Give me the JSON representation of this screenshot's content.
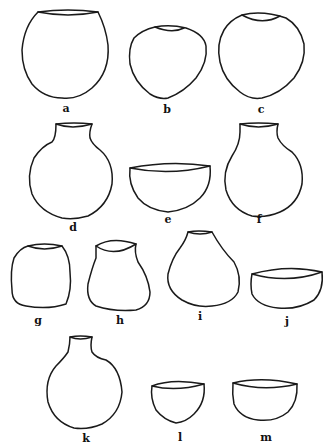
{
  "figure": {
    "stroke_color": "#1a1a1a",
    "background": "#ffffff",
    "vessels": [
      {
        "id": "a",
        "label": "a",
        "form": "large globular jar with wide mouth"
      },
      {
        "id": "b",
        "label": "b",
        "form": "small globular jar with narrow mouth"
      },
      {
        "id": "c",
        "label": "c",
        "form": "globular jar with restricted mouth"
      },
      {
        "id": "d",
        "label": "d",
        "form": "necked globular jar"
      },
      {
        "id": "e",
        "label": "e",
        "form": "hemispherical bowl"
      },
      {
        "id": "f",
        "label": "f",
        "form": "necked globular jar"
      },
      {
        "id": "g",
        "label": "g",
        "form": "barrel-shaped jar"
      },
      {
        "id": "h",
        "label": "h",
        "form": "waisted jar with flaring rim"
      },
      {
        "id": "i",
        "label": "i",
        "form": "pear-shaped jar"
      },
      {
        "id": "j",
        "label": "j",
        "form": "shallow bowl"
      },
      {
        "id": "k",
        "label": "k",
        "form": "bottle with narrow neck"
      },
      {
        "id": "l",
        "label": "l",
        "form": "small deep bowl"
      },
      {
        "id": "m",
        "label": "m",
        "form": "deep bowl"
      }
    ]
  }
}
